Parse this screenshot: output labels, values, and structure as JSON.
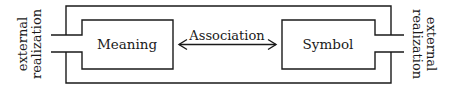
{
  "diagram": {
    "nodes": [
      {
        "id": "meaning",
        "label": "Meaning"
      },
      {
        "id": "symbol",
        "label": "Symbol"
      }
    ],
    "edges": [
      {
        "from": "meaning",
        "to": "symbol",
        "label": "Association",
        "direction": "bidirectional"
      }
    ],
    "side_labels": {
      "left": {
        "line1": "external",
        "line2": "realization"
      },
      "right": {
        "line1": "external",
        "line2": "realization"
      }
    },
    "colors": {
      "stroke": "#1a1a1a",
      "background": "#ffffff"
    }
  }
}
